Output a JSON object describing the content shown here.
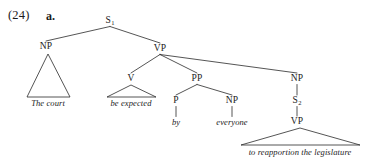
{
  "example": {
    "number": "(24)",
    "letter": "a."
  },
  "tree": {
    "nodes": [
      {
        "id": "s1",
        "label": "S",
        "subscript": "1",
        "x": 110,
        "y": 21
      },
      {
        "id": "np1",
        "label": "NP",
        "subscript": "",
        "x": 46,
        "y": 47
      },
      {
        "id": "vp1",
        "label": "VP",
        "subscript": "",
        "x": 160,
        "y": 49
      },
      {
        "id": "v",
        "label": "V",
        "subscript": "",
        "x": 131,
        "y": 79
      },
      {
        "id": "pp",
        "label": "PP",
        "subscript": "",
        "x": 197,
        "y": 79
      },
      {
        "id": "p",
        "label": "P",
        "subscript": "",
        "x": 176,
        "y": 101
      },
      {
        "id": "np2",
        "label": "NP",
        "subscript": "",
        "x": 232,
        "y": 101
      },
      {
        "id": "np3",
        "label": "NP",
        "subscript": "",
        "x": 297,
        "y": 79
      },
      {
        "id": "s2",
        "label": "S",
        "subscript": "2",
        "x": 297,
        "y": 101
      },
      {
        "id": "vp2",
        "label": "VP",
        "subscript": "",
        "x": 297,
        "y": 122
      }
    ],
    "terminals": [
      {
        "id": "t-the-court",
        "text": "The court",
        "x": 48,
        "y": 103
      },
      {
        "id": "t-be-expected",
        "text": "be expected",
        "x": 131,
        "y": 103
      },
      {
        "id": "t-by",
        "text": "by",
        "x": 176,
        "y": 122
      },
      {
        "id": "t-everyone",
        "text": "everyone",
        "x": 232,
        "y": 122
      },
      {
        "id": "t-reapportion",
        "text": "to reapportion the legislature",
        "x": 300,
        "y": 152
      }
    ],
    "triangles": [
      {
        "id": "tri-np1",
        "apex_x": 48,
        "apex_y": 54,
        "left_x": 27,
        "right_x": 70,
        "base_y": 97
      },
      {
        "id": "tri-v",
        "apex_x": 131,
        "apex_y": 85,
        "left_x": 107,
        "right_x": 156,
        "base_y": 97
      },
      {
        "id": "tri-vp2",
        "apex_x": 300,
        "apex_y": 128,
        "left_x": 241,
        "right_x": 360,
        "base_y": 145
      }
    ],
    "edges": [
      {
        "id": "e-s1-np1",
        "from": "s1",
        "to": "np1"
      },
      {
        "id": "e-s1-vp1",
        "from": "s1",
        "to": "vp1"
      },
      {
        "id": "e-vp1-v",
        "from": "vp1",
        "to": "v"
      },
      {
        "id": "e-vp1-pp",
        "from": "vp1",
        "to": "pp"
      },
      {
        "id": "e-vp1-np3",
        "from": "vp1",
        "to": "np3"
      },
      {
        "id": "e-pp-p",
        "from": "pp",
        "to": "p"
      },
      {
        "id": "e-pp-np2",
        "from": "pp",
        "to": "np2"
      },
      {
        "id": "e-p-by",
        "from": "p",
        "to": "t-by"
      },
      {
        "id": "e-np2-ev",
        "from": "np2",
        "to": "t-everyone"
      },
      {
        "id": "e-np3-s2",
        "from": "np3",
        "to": "s2"
      },
      {
        "id": "e-s2-vp2",
        "from": "s2",
        "to": "vp2"
      }
    ]
  },
  "style": {
    "line_color": "#2a2a2a",
    "text_color": "#1b1b1b",
    "background": "#ffffff"
  }
}
